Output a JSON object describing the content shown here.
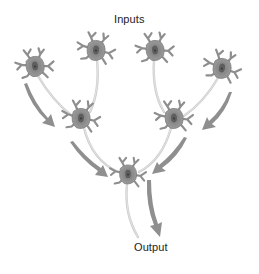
{
  "diagram": {
    "type": "neural-convergence",
    "labels": {
      "inputs": "Inputs",
      "output": "Output"
    },
    "colors": {
      "background": "#ffffff",
      "neuron_body": "#8a8a8a",
      "neuron_nucleus": "#5e5e5e",
      "axon": "#c4c4c4",
      "arrow": "#8f8f8f",
      "text": "#222222"
    },
    "neurons": [
      {
        "id": "input-1",
        "layer": "input",
        "x": 35,
        "y": 66
      },
      {
        "id": "input-2",
        "layer": "input",
        "x": 96,
        "y": 50
      },
      {
        "id": "input-3",
        "layer": "input",
        "x": 155,
        "y": 50
      },
      {
        "id": "input-4",
        "layer": "input",
        "x": 222,
        "y": 68
      },
      {
        "id": "hidden-1",
        "layer": "hidden",
        "x": 81,
        "y": 118
      },
      {
        "id": "hidden-2",
        "layer": "hidden",
        "x": 174,
        "y": 118
      },
      {
        "id": "output-1",
        "layer": "output",
        "x": 128,
        "y": 174
      }
    ],
    "connections": [
      {
        "from": "input-1",
        "to": "hidden-1"
      },
      {
        "from": "input-2",
        "to": "hidden-1"
      },
      {
        "from": "input-3",
        "to": "hidden-2"
      },
      {
        "from": "input-4",
        "to": "hidden-2"
      },
      {
        "from": "hidden-1",
        "to": "output-1"
      },
      {
        "from": "hidden-2",
        "to": "output-1"
      }
    ]
  }
}
